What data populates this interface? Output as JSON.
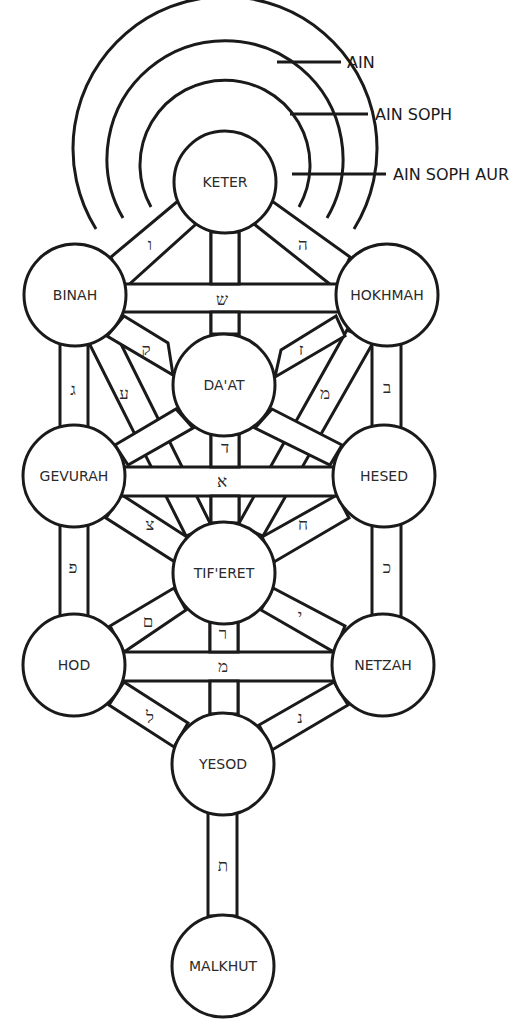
{
  "diagram": {
    "colors": {
      "line": "#1a1a1a",
      "text": "#2a2a2a",
      "fill": "#ffffff"
    },
    "veils": [
      {
        "label": "AIN"
      },
      {
        "label": "AIN SOPH"
      },
      {
        "label": "AIN SOPH AUR"
      }
    ],
    "sefirot": {
      "keter": "KETER",
      "binah": "BINAH",
      "hokhmah": "HOKHMAH",
      "daat": "DA'AT",
      "gevurah": "GEVURAH",
      "hesed": "HESED",
      "tiferet": "TIF'ERET",
      "hod": "HOD",
      "netzah": "NETZAH",
      "yesod": "YESOD",
      "malkhut": "MALKHUT"
    },
    "paths": {
      "keter_binah": "ו",
      "keter_hokhmah": "ה",
      "binah_hokhmah": "ש",
      "binah_daat": "ק",
      "hokhmah_daat": "ז",
      "binah_gevurah": "ג",
      "binah_tiferet": "ע",
      "hokhmah_hesed": "ב",
      "hokhmah_tiferet": "מ",
      "daat_tiferet": "ד",
      "gevurah_hesed": "א",
      "gevurah_tiferet": "צ",
      "hesed_tiferet": "ח",
      "gevurah_hod": "פ",
      "hesed_netzah": "כ",
      "tiferet_hod": "ם",
      "tiferet_yesod": "ר",
      "tiferet_netzah": "י",
      "hod_netzah": "מ",
      "hod_yesod": "ל",
      "netzah_yesod": "נ",
      "yesod_malkhut": "ת"
    }
  }
}
